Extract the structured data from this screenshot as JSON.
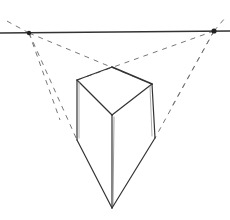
{
  "diagram": {
    "type": "three-point-perspective-box-sketch",
    "colors": {
      "background": "#ffffff",
      "line": "#333333",
      "guide": "#777777",
      "vp": "#222222"
    },
    "horizon": {
      "x1": 0,
      "y1": 33,
      "x2": 230,
      "y2": 31
    },
    "vanishing_points": [
      {
        "name": "left-vp",
        "x": 29,
        "y": 33
      },
      {
        "name": "right-vp",
        "x": 214,
        "y": 31
      }
    ],
    "box": {
      "top": [
        112,
        67
      ],
      "left_top": [
        77,
        80
      ],
      "right_top": [
        152,
        84
      ],
      "center": [
        112,
        115
      ],
      "left_bottom": [
        77,
        140
      ],
      "right_bottom": [
        155,
        138
      ],
      "apex": [
        112,
        208
      ]
    }
  }
}
